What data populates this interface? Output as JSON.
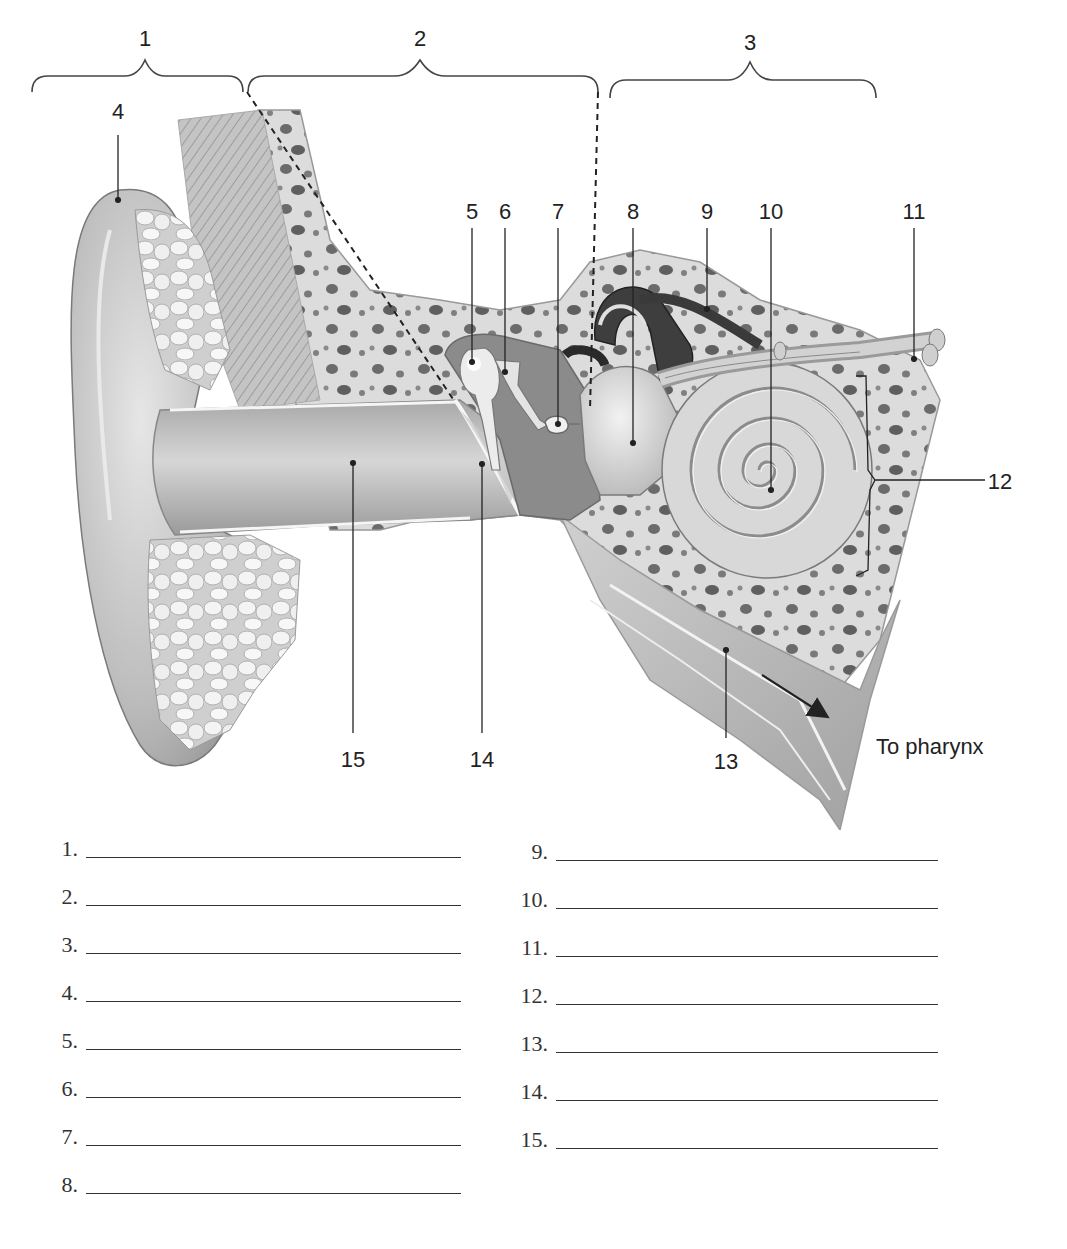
{
  "diagram": {
    "bracket_labels": [
      {
        "id": "1",
        "text": "1",
        "x": 145,
        "y": 30
      },
      {
        "id": "2",
        "text": "2",
        "x": 420,
        "y": 30
      },
      {
        "id": "3",
        "text": "3",
        "x": 750,
        "y": 33
      }
    ],
    "structure_labels": [
      {
        "id": "4",
        "text": "4",
        "x": 118,
        "y": 103
      },
      {
        "id": "5",
        "text": "5",
        "x": 472,
        "y": 202
      },
      {
        "id": "6",
        "text": "6",
        "x": 505,
        "y": 202
      },
      {
        "id": "7",
        "text": "7",
        "x": 558,
        "y": 202
      },
      {
        "id": "8",
        "text": "8",
        "x": 633,
        "y": 202
      },
      {
        "id": "9",
        "text": "9",
        "x": 707,
        "y": 202
      },
      {
        "id": "10",
        "text": "10",
        "x": 771,
        "y": 202
      },
      {
        "id": "11",
        "text": "11",
        "x": 914,
        "y": 202
      },
      {
        "id": "12",
        "text": "12",
        "x": 998,
        "y": 472
      },
      {
        "id": "13",
        "text": "13",
        "x": 725,
        "y": 752
      },
      {
        "id": "14",
        "text": "14",
        "x": 481,
        "y": 750
      },
      {
        "id": "15",
        "text": "15",
        "x": 352,
        "y": 750
      }
    ],
    "annotation": {
      "text": "To pharynx",
      "x": 876,
      "y": 737
    },
    "colors": {
      "ink": "#222222",
      "skin": "#b9b9b9",
      "bone": "#d9d9d9",
      "bone_pore": "#6e6e6e",
      "cavity": "#8a8a8a",
      "cartilage": "#e8e8e8"
    }
  },
  "answer_sheet": {
    "left_column": [
      {
        "number": "1.",
        "value": ""
      },
      {
        "number": "2.",
        "value": ""
      },
      {
        "number": "3.",
        "value": ""
      },
      {
        "number": "4.",
        "value": ""
      },
      {
        "number": "5.",
        "value": ""
      },
      {
        "number": "6.",
        "value": ""
      },
      {
        "number": "7.",
        "value": ""
      },
      {
        "number": "8.",
        "value": ""
      }
    ],
    "right_column": [
      {
        "number": "9.",
        "value": ""
      },
      {
        "number": "10.",
        "value": ""
      },
      {
        "number": "11.",
        "value": ""
      },
      {
        "number": "12.",
        "value": ""
      },
      {
        "number": "13.",
        "value": ""
      },
      {
        "number": "14.",
        "value": ""
      },
      {
        "number": "15.",
        "value": ""
      }
    ]
  }
}
